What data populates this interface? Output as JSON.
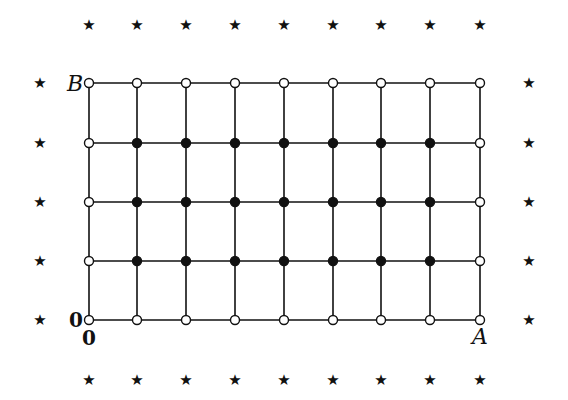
{
  "diagram": {
    "type": "lattice-grid",
    "grid": {
      "columns_x": [
        89,
        137,
        186,
        235,
        284,
        333,
        381,
        430,
        480
      ],
      "rows_y": [
        83,
        143,
        202,
        261,
        320
      ],
      "line_color": "#111111",
      "line_width": 1.6,
      "point_radius": 4.5,
      "boundary_point_style": "open-circle",
      "interior_point_style": "filled-circle"
    },
    "stars": {
      "glyph": "★",
      "top_row": {
        "y": 25,
        "x": [
          89,
          137,
          186,
          235,
          284,
          333,
          381,
          430,
          480
        ]
      },
      "bottom_row": {
        "y": 380,
        "x": [
          89,
          137,
          186,
          235,
          284,
          333,
          381,
          430,
          480
        ]
      },
      "left_column": {
        "x": 40,
        "y": [
          83,
          143,
          202,
          261,
          320
        ]
      },
      "right_column": {
        "x": 529,
        "y": [
          83,
          143,
          202,
          261,
          320
        ]
      }
    },
    "labels": {
      "B": {
        "text": "B",
        "x": 75,
        "y": 84,
        "style": "italic"
      },
      "A": {
        "text": "A",
        "x": 480,
        "y": 337,
        "style": "italic"
      },
      "origin_left": {
        "text": "0",
        "x": 76,
        "y": 320,
        "style": "bold"
      },
      "origin_below": {
        "text": "0",
        "x": 89,
        "y": 338,
        "style": "bold"
      }
    }
  }
}
